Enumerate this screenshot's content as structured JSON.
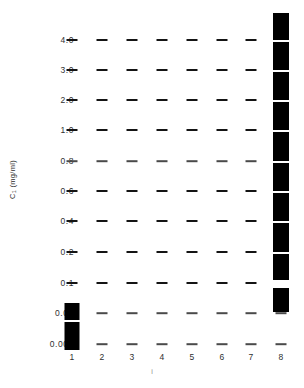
{
  "chart_data": {
    "type": "scatter",
    "title": "",
    "xlabel": "i",
    "ylabel": "C₁ (mg/ml)",
    "ylabel_main": "C",
    "ylabel_sub": "1",
    "ylabel_units": " (mg/ml)",
    "grid": false,
    "legend": "none",
    "x_categories": [
      "1",
      "2",
      "3",
      "4",
      "5",
      "6",
      "7",
      "8"
    ],
    "y_tick_labels": [
      "4.0",
      "3.0",
      "2.0",
      "1.0",
      "0.8",
      "0.6",
      "0.4",
      "0.2",
      "0.1",
      "0.01",
      "0.001"
    ],
    "y_tick_values": [
      4.0,
      3.0,
      2.0,
      1.0,
      0.8,
      0.6,
      0.4,
      0.2,
      0.1,
      0.01,
      0.001
    ],
    "marker_style": "horizontal-dash",
    "series": [
      {
        "name": "1",
        "lane": 1,
        "dashes": [
          "4.0",
          "3.0",
          "2.0",
          "1.0",
          "0.8",
          "0.6",
          "0.4",
          "0.2",
          "0.1"
        ],
        "filled_blocks": [
          "0.01",
          "0.001"
        ]
      },
      {
        "name": "2",
        "lane": 2,
        "dashes": [
          "4.0",
          "3.0",
          "2.0",
          "1.0",
          "0.8",
          "0.6",
          "0.4",
          "0.2",
          "0.1",
          "0.01",
          "0.001"
        ],
        "filled_blocks": []
      },
      {
        "name": "3",
        "lane": 3,
        "dashes": [
          "4.0",
          "3.0",
          "2.0",
          "1.0",
          "0.8",
          "0.6",
          "0.4",
          "0.2",
          "0.1",
          "0.01",
          "0.001"
        ],
        "filled_blocks": []
      },
      {
        "name": "4",
        "lane": 4,
        "dashes": [
          "4.0",
          "3.0",
          "2.0",
          "1.0",
          "0.8",
          "0.6",
          "0.4",
          "0.2",
          "0.1",
          "0.01",
          "0.001"
        ],
        "filled_blocks": []
      },
      {
        "name": "5",
        "lane": 5,
        "dashes": [
          "4.0",
          "3.0",
          "2.0",
          "1.0",
          "0.8",
          "0.6",
          "0.4",
          "0.2",
          "0.1",
          "0.01",
          "0.001"
        ],
        "filled_blocks": []
      },
      {
        "name": "6",
        "lane": 6,
        "dashes": [
          "4.0",
          "3.0",
          "2.0",
          "1.0",
          "0.8",
          "0.6",
          "0.4",
          "0.2",
          "0.1",
          "0.01",
          "0.001"
        ],
        "filled_blocks": []
      },
      {
        "name": "7",
        "lane": 7,
        "dashes": [
          "4.0",
          "3.0",
          "2.0",
          "1.0",
          "0.8",
          "0.6",
          "0.4",
          "0.2",
          "0.1",
          "0.01",
          "0.001"
        ],
        "filled_blocks": []
      },
      {
        "name": "8",
        "lane": 8,
        "dashes": [
          "0.01",
          "0.001"
        ],
        "filled_blocks": [
          "4.0",
          "3.0",
          "2.0",
          "1.0",
          "0.8",
          "0.6",
          "0.4",
          "0.2",
          "0.1"
        ]
      }
    ]
  },
  "geometry": {
    "row_y": [
      40,
      70,
      100,
      130,
      161,
      191,
      221,
      252,
      283,
      313,
      344
    ],
    "lane_x": [
      72,
      102,
      132,
      162,
      192,
      222,
      251,
      281
    ],
    "dash_faint_rows": [
      4,
      9,
      10
    ],
    "lane1_blocks": [
      {
        "top": 303,
        "height": 17,
        "width": 15
      },
      {
        "top": 322,
        "height": 28,
        "width": 15
      }
    ],
    "lane8_blocks": [
      {
        "top": 13,
        "height": 27,
        "width": 16
      },
      {
        "top": 42,
        "height": 28,
        "width": 16
      },
      {
        "top": 72,
        "height": 28,
        "width": 16
      },
      {
        "top": 102,
        "height": 28,
        "width": 16
      },
      {
        "top": 132,
        "height": 29,
        "width": 16
      },
      {
        "top": 163,
        "height": 28,
        "width": 16
      },
      {
        "top": 193,
        "height": 28,
        "width": 16
      },
      {
        "top": 223,
        "height": 29,
        "width": 16
      },
      {
        "top": 254,
        "height": 26,
        "width": 16
      },
      {
        "top": 288,
        "height": 24,
        "width": 16
      }
    ]
  },
  "colors": {
    "ink": "#000000",
    "dash": "#141414",
    "dash_faint": "#4a4a4a",
    "tick_text": "#2f2f2f",
    "axis_title": "#8a8a8a",
    "background": "#ffffff"
  }
}
